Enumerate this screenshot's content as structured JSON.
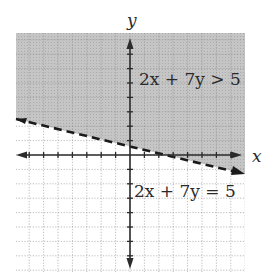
{
  "chart_data": {
    "type": "line",
    "title": "",
    "xlabel": "x",
    "ylabel": "y",
    "xlim": [
      -8,
      8
    ],
    "ylim": [
      -8,
      8
    ],
    "grid": true,
    "legend": null,
    "series": [
      {
        "name": "2x + 7y = 5",
        "style": "dashed",
        "equation": "2x + 7y = 5",
        "points": [
          [
            -8,
            3
          ],
          [
            0,
            0.71
          ],
          [
            2.5,
            0
          ],
          [
            8,
            -1.57
          ]
        ]
      }
    ],
    "shaded_region": {
      "inequality": "2x + 7y > 5",
      "side": "above"
    },
    "annotations": [
      {
        "text": "2x + 7y > 5",
        "position": "upper right of y-axis"
      },
      {
        "text": "2x + 7y = 5",
        "position": "below x-axis, right of y-axis"
      }
    ]
  },
  "labels": {
    "x_axis": "x",
    "y_axis": "y",
    "inequality": "2x + 7y > 5",
    "boundary": "2x + 7y = 5"
  },
  "colors": {
    "shade": "#bdbdbd",
    "grid": "#9a9a9a",
    "axis": "#2b2b2b",
    "boundary": "#1a1a1a"
  },
  "geometry": {
    "grid_left": 16,
    "grid_right": 245,
    "grid_top": 33,
    "grid_bottom": 272,
    "origin_x": 130,
    "origin_y": 155,
    "unit": 14.4,
    "line_start": [
      16,
      119
    ],
    "line_end": [
      244,
      174
    ]
  }
}
